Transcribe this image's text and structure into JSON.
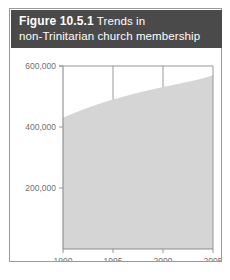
{
  "figure": {
    "caption_label": "Figure 10.5.1",
    "caption_text": "Trends in",
    "caption_line2": "non-Trinitarian church membership",
    "header_color": "#4a4a4a",
    "border_color": "#9a9a9a"
  },
  "chart_data": {
    "type": "area",
    "title": "Trends in non-Trinitarian church membership",
    "xlabel": "",
    "ylabel": "",
    "x": [
      1990,
      1991,
      1992,
      1993,
      1994,
      1995,
      1996,
      1997,
      1998,
      1999,
      2000,
      2001,
      2002,
      2003,
      2004,
      2005
    ],
    "values": [
      430000,
      444000,
      457000,
      469000,
      480000,
      490000,
      499000,
      508000,
      516000,
      524000,
      531000,
      538000,
      545000,
      552000,
      560000,
      570000
    ],
    "series": [
      {
        "name": "non-Trinitarian church membership",
        "values": [
          430000,
          444000,
          457000,
          469000,
          480000,
          490000,
          499000,
          508000,
          516000,
          524000,
          531000,
          538000,
          545000,
          552000,
          560000,
          570000
        ]
      }
    ],
    "xlim": [
      1990,
      2005
    ],
    "ylim": [
      0,
      600000
    ],
    "xticks": [
      1990,
      1995,
      2000,
      2005
    ],
    "xtick_labels": [
      "1990",
      "1995",
      "2000",
      "2005"
    ],
    "yticks": [
      200000,
      400000,
      600000
    ],
    "ytick_labels": [
      "200,000",
      "400,000",
      "600,000"
    ],
    "grid": "vertical-at-1995-and-2000",
    "legend": "none",
    "area_fill_color": "#d5d5d5",
    "axis_color": "#8c8c8c",
    "tick_label_color": "#707070"
  }
}
